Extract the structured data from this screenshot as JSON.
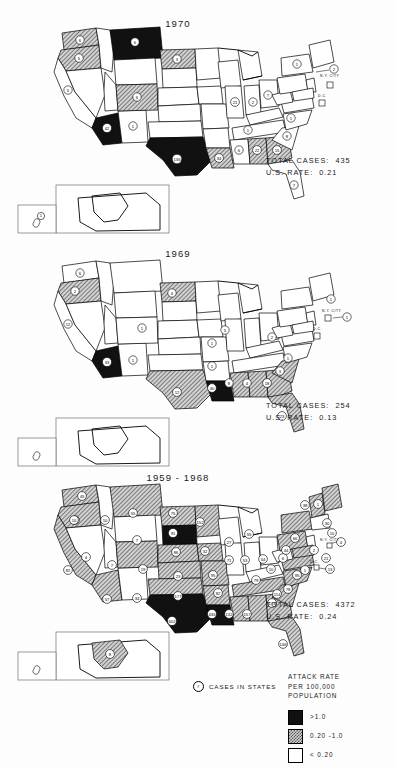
{
  "figure": {
    "legend": {
      "title_lines": [
        "ATTACK RATE",
        "PER 100,000",
        "POPULATION"
      ],
      "entries": [
        {
          "id": "high",
          "label": ">1.0",
          "swatch": "black-solid"
        },
        {
          "id": "mid",
          "label": "0.20 -1.0",
          "swatch": "gray-hatched"
        },
        {
          "id": "low",
          "label": "< 0.20",
          "swatch": "white-empty"
        }
      ]
    },
    "cases_key": {
      "symbol_value": "7",
      "label": "CASES IN STATES"
    },
    "city_labels": {
      "nyc": "N.Y. CITY",
      "dc": "D.C."
    }
  },
  "maps": [
    {
      "id": "map-1970",
      "title": "1970",
      "total_cases_label": "TOTAL CASES:  435",
      "us_rate_label": "U.S. RATE:  0.21",
      "total_cases": 435,
      "us_rate": 0.21,
      "states": {
        "WA": {
          "v": "5",
          "class": "mid"
        },
        "OR": {
          "v": "6",
          "class": "mid"
        },
        "CA": {
          "v": "5",
          "class": "low"
        },
        "NV": {
          "v": "",
          "class": "low"
        },
        "ID": {
          "v": "",
          "class": "low"
        },
        "MT": {
          "v": "6",
          "class": "high"
        },
        "WY": {
          "v": "",
          "class": "low"
        },
        "UT": {
          "v": "",
          "class": "low"
        },
        "AZ": {
          "v": "42",
          "class": "high"
        },
        "NM": {
          "v": "1",
          "class": "low"
        },
        "CO": {
          "v": "6",
          "class": "mid"
        },
        "ND": {
          "v": "3",
          "class": "mid"
        },
        "SD": {
          "v": "",
          "class": "low"
        },
        "NE": {
          "v": "",
          "class": "low"
        },
        "KS": {
          "v": "",
          "class": "low"
        },
        "OK": {
          "v": "",
          "class": "low"
        },
        "TX": {
          "v": "136",
          "class": "high"
        },
        "MN": {
          "v": "",
          "class": "low"
        },
        "IA": {
          "v": "",
          "class": "low"
        },
        "MO": {
          "v": "",
          "class": "low"
        },
        "AR": {
          "v": "",
          "class": "low"
        },
        "LA": {
          "v": "34",
          "class": "mid"
        },
        "WI": {
          "v": "",
          "class": "low"
        },
        "IL": {
          "v": "21",
          "class": "low"
        },
        "MI": {
          "v": "",
          "class": "low"
        },
        "IN": {
          "v": "2",
          "class": "low"
        },
        "OH": {
          "v": "7",
          "class": "low"
        },
        "KY": {
          "v": "",
          "class": "low"
        },
        "TN": {
          "v": "1",
          "class": "low"
        },
        "MS": {
          "v": "6",
          "class": "low"
        },
        "AL": {
          "v": "22",
          "class": "mid"
        },
        "GA": {
          "v": "15",
          "class": "mid"
        },
        "FL": {
          "v": "7",
          "class": "low"
        },
        "SC": {
          "v": "8",
          "class": "low"
        },
        "NC": {
          "v": "1",
          "class": "low"
        },
        "VA": {
          "v": "",
          "class": "low"
        },
        "WV": {
          "v": "",
          "class": "low"
        },
        "PA": {
          "v": "",
          "class": "low"
        },
        "NY": {
          "v": "1",
          "class": "low"
        },
        "NJ": {
          "v": "",
          "class": "low"
        },
        "NYC": {
          "v": "2",
          "class": "low"
        },
        "MD": {
          "v": "",
          "class": "low"
        },
        "DE": {
          "v": "",
          "class": "low"
        },
        "DC": {
          "v": "",
          "class": "low"
        },
        "NE_states": {
          "v": "",
          "class": "low"
        },
        "AK": {
          "v": "",
          "class": "low"
        },
        "HI": {
          "v": "1",
          "class": "low"
        }
      }
    },
    {
      "id": "map-1969",
      "title": "1969",
      "total_cases_label": "TOTAL CASES:  254",
      "us_rate_label": "U.S. RATE:  0.13",
      "total_cases": 254,
      "us_rate": 0.13,
      "states": {
        "WA": {
          "v": "2",
          "class": "low"
        },
        "OR": {
          "v": "6",
          "class": "mid"
        },
        "CA": {
          "v": "12",
          "class": "low"
        },
        "NV": {
          "v": "",
          "class": "low"
        },
        "ID": {
          "v": "",
          "class": "low"
        },
        "MT": {
          "v": "",
          "class": "low"
        },
        "WY": {
          "v": "",
          "class": "low"
        },
        "UT": {
          "v": "1",
          "class": "low"
        },
        "AZ": {
          "v": "33",
          "class": "high"
        },
        "NM": {
          "v": "1",
          "class": "low"
        },
        "CO": {
          "v": "",
          "class": "low"
        },
        "ND": {
          "v": "4",
          "class": "mid"
        },
        "SD": {
          "v": "",
          "class": "low"
        },
        "NE": {
          "v": "",
          "class": "low"
        },
        "KS": {
          "v": "",
          "class": "low"
        },
        "OK": {
          "v": "",
          "class": "low"
        },
        "TX": {
          "v": "12",
          "class": "mid"
        },
        "MN": {
          "v": "5",
          "class": "low"
        },
        "IA": {
          "v": "1",
          "class": "low"
        },
        "MO": {
          "v": "1",
          "class": "low"
        },
        "AR": {
          "v": "",
          "class": "low"
        },
        "LA": {
          "v": "40",
          "class": "high"
        },
        "WI": {
          "v": "",
          "class": "low"
        },
        "IL": {
          "v": "",
          "class": "low"
        },
        "MI": {
          "v": "",
          "class": "low"
        },
        "IN": {
          "v": "",
          "class": "low"
        },
        "OH": {
          "v": "2",
          "class": "low"
        },
        "KY": {
          "v": "",
          "class": "low"
        },
        "TN": {
          "v": "",
          "class": "low"
        },
        "MS": {
          "v": "8",
          "class": "mid"
        },
        "AL": {
          "v": "4",
          "class": "mid"
        },
        "GA": {
          "v": "18",
          "class": "mid"
        },
        "FL": {
          "v": "23",
          "class": "mid"
        },
        "SC": {
          "v": "3",
          "class": "mid"
        },
        "NC": {
          "v": "1",
          "class": "low"
        },
        "VA": {
          "v": "",
          "class": "low"
        },
        "WV": {
          "v": "",
          "class": "low"
        },
        "PA": {
          "v": "",
          "class": "low"
        },
        "NY": {
          "v": "1",
          "class": "low"
        },
        "NJ": {
          "v": "",
          "class": "low"
        },
        "NYC": {
          "v": "1",
          "class": "low"
        },
        "MD": {
          "v": "",
          "class": "low"
        },
        "DE": {
          "v": "",
          "class": "low"
        },
        "DC": {
          "v": "",
          "class": "low"
        },
        "AK": {
          "v": "",
          "class": "low"
        },
        "HI": {
          "v": "",
          "class": "low"
        }
      }
    },
    {
      "id": "map-1959-1968",
      "title": "1959 - 1968",
      "total_cases_label": "TOTAL CASES:  4372",
      "us_rate_label": "U.S. RATE:  0.24",
      "total_cases": 4372,
      "us_rate": 0.24,
      "states": {
        "WA": {
          "v": "45",
          "class": "mid"
        },
        "OR": {
          "v": "5",
          "class": "mid"
        },
        "CA": {
          "v": "82",
          "class": "mid"
        },
        "NV": {
          "v": "4",
          "class": "low"
        },
        "ID": {
          "v": "10",
          "class": "low"
        },
        "MT": {
          "v": "55",
          "class": "mid"
        },
        "WY": {
          "v": "7",
          "class": "low"
        },
        "UT": {
          "v": "7",
          "class": "low"
        },
        "AZ": {
          "v": "57",
          "class": "mid"
        },
        "NM": {
          "v": "34",
          "class": "low"
        },
        "CO": {
          "v": "19",
          "class": "mid"
        },
        "ND": {
          "v": "75",
          "class": "mid"
        },
        "SD": {
          "v": "91",
          "class": "high"
        },
        "NE": {
          "v": "86",
          "class": "mid"
        },
        "KS": {
          "v": "23",
          "class": "mid"
        },
        "OK": {
          "v": "177",
          "class": "mid"
        },
        "TX": {
          "v": "502",
          "class": "high"
        },
        "MN": {
          "v": "152",
          "class": "mid"
        },
        "IA": {
          "v": "32",
          "class": "mid"
        },
        "MO": {
          "v": "95",
          "class": "mid"
        },
        "AR": {
          "v": "82",
          "class": "mid"
        },
        "LA": {
          "v": "436",
          "class": "high"
        },
        "WI": {
          "v": "27",
          "class": "low"
        },
        "IL": {
          "v": "71",
          "class": "low"
        },
        "MI": {
          "v": "55",
          "class": "low"
        },
        "IN": {
          "v": "53",
          "class": "low"
        },
        "OH": {
          "v": "54",
          "class": "low"
        },
        "KY": {
          "v": "10",
          "class": "low"
        },
        "TN": {
          "v": "79",
          "class": "mid"
        },
        "MS": {
          "v": "132",
          "class": "mid"
        },
        "AL": {
          "v": "157",
          "class": "mid"
        },
        "GA": {
          "v": "174",
          "class": "mid"
        },
        "FL": {
          "v": "146",
          "class": "mid"
        },
        "SC": {
          "v": "114",
          "class": "mid"
        },
        "NC": {
          "v": "78",
          "class": "mid"
        },
        "VA": {
          "v": "95",
          "class": "mid"
        },
        "WV": {
          "v": "6",
          "class": "low"
        },
        "PA": {
          "v": "44",
          "class": "mid"
        },
        "NY": {
          "v": "66",
          "class": "mid"
        },
        "NJ": {
          "v": "2",
          "class": "low"
        },
        "NYC": {
          "v": "4",
          "class": "low"
        },
        "MD": {
          "v": "21",
          "class": "mid"
        },
        "DE": {
          "v": "1",
          "class": "low"
        },
        "DC": {
          "v": "13",
          "class": "low"
        },
        "ME": {
          "v": "1",
          "class": "low"
        },
        "NH": {
          "v": "30",
          "class": "mid"
        },
        "VT": {
          "v": "38",
          "class": "mid"
        },
        "MA": {
          "v": "10",
          "class": "low"
        },
        "AK": {
          "v": "8",
          "class": "mid"
        },
        "HI": {
          "v": "",
          "class": "low"
        }
      }
    }
  ]
}
